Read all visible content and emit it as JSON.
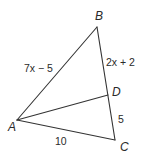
{
  "figure": {
    "points": {
      "A": {
        "label": "A",
        "x": 17,
        "y": 120
      },
      "B": {
        "label": "B",
        "x": 97,
        "y": 27
      },
      "C": {
        "label": "C",
        "x": 115,
        "y": 140
      },
      "D": {
        "label": "D",
        "x": 108,
        "y": 95
      }
    },
    "segments": [
      {
        "from": "A",
        "to": "B",
        "length_label": "7x − 5"
      },
      {
        "from": "B",
        "to": "D",
        "length_label": "2x + 2"
      },
      {
        "from": "D",
        "to": "C",
        "length_label": "5"
      },
      {
        "from": "A",
        "to": "C",
        "length_label": "10"
      },
      {
        "from": "A",
        "to": "D",
        "length_label": ""
      }
    ],
    "labels": {
      "A": "A",
      "B": "B",
      "C": "C",
      "D": "D",
      "AB": "7x − 5",
      "BD": "2x + 2",
      "DC": "5",
      "AC": "10"
    },
    "line_color": "#333333"
  }
}
